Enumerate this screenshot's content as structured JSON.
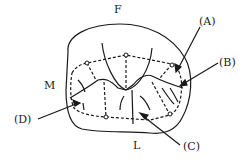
{
  "diagram": {
    "orientation_labels": {
      "top": "F",
      "left": "M",
      "bottom": "L"
    },
    "callouts": [
      {
        "id": "A",
        "label": "(A)"
      },
      {
        "id": "B",
        "label": "(B)"
      },
      {
        "id": "C",
        "label": "(C)"
      },
      {
        "id": "D",
        "label": "(D)"
      }
    ],
    "colors": {
      "ink": "#1a1a1a",
      "background": "#ffffff"
    }
  }
}
